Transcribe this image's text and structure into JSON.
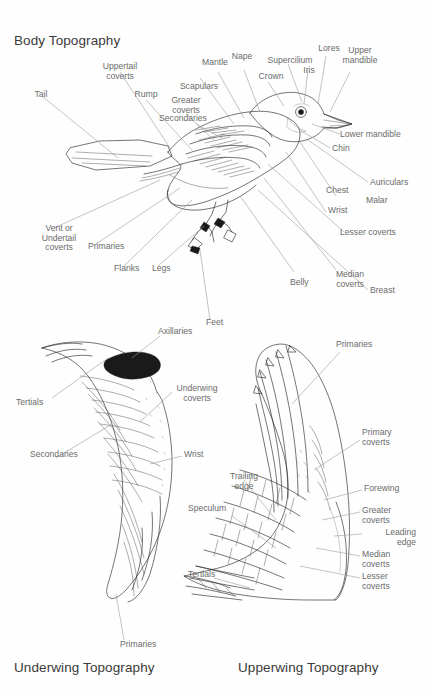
{
  "document": {
    "kind": "bird-anatomy-topography-diagram",
    "background_color": "#fefefe",
    "label_color": "#6b6b6b",
    "title_color": "#3a3a3a",
    "ink_color": "#2b2b2b",
    "leader_color": "#9a9a9a"
  },
  "sections": {
    "body": {
      "title": "Body Topography",
      "labels": [
        {
          "id": "tail",
          "text": "Tail"
        },
        {
          "id": "uppertail-coverts",
          "text": "Uppertail\ncoverts"
        },
        {
          "id": "rump",
          "text": "Rump"
        },
        {
          "id": "greater-coverts",
          "text": "Greater\ncoverts"
        },
        {
          "id": "secondaries",
          "text": "Secondaries"
        },
        {
          "id": "scapulars",
          "text": "Scapulars"
        },
        {
          "id": "mantle",
          "text": "Mantle"
        },
        {
          "id": "nape",
          "text": "Nape"
        },
        {
          "id": "crown",
          "text": "Crown"
        },
        {
          "id": "supercilium",
          "text": "Supercilium"
        },
        {
          "id": "iris",
          "text": "Iris"
        },
        {
          "id": "lores",
          "text": "Lores"
        },
        {
          "id": "upper-mandible",
          "text": "Upper\nmandible"
        },
        {
          "id": "lower-mandible",
          "text": "Lower mandible"
        },
        {
          "id": "chin",
          "text": "Chin"
        },
        {
          "id": "auriculars",
          "text": "Auriculars"
        },
        {
          "id": "malar",
          "text": "Malar"
        },
        {
          "id": "chest",
          "text": "Chest"
        },
        {
          "id": "wrist",
          "text": "Wrist"
        },
        {
          "id": "lesser-coverts",
          "text": "Lesser coverts"
        },
        {
          "id": "median-coverts",
          "text": "Median\ncoverts"
        },
        {
          "id": "breast",
          "text": "Breast"
        },
        {
          "id": "belly",
          "text": "Belly"
        },
        {
          "id": "feet",
          "text": "Feet"
        },
        {
          "id": "legs",
          "text": "Legs"
        },
        {
          "id": "flanks",
          "text": "Flanks"
        },
        {
          "id": "primaries",
          "text": "Primaries"
        },
        {
          "id": "vent-or-undertail-coverts",
          "text": "Vent or\nUndertail\ncoverts"
        }
      ]
    },
    "underwing": {
      "title": "Underwing Topography",
      "labels": [
        {
          "id": "axillaries",
          "text": "Axillaries"
        },
        {
          "id": "underwing-coverts",
          "text": "Underwing\ncoverts"
        },
        {
          "id": "tertials",
          "text": "Tertials"
        },
        {
          "id": "secondaries",
          "text": "Secondaries"
        },
        {
          "id": "wrist",
          "text": "Wrist"
        },
        {
          "id": "primaries",
          "text": "Primaries"
        }
      ]
    },
    "upperwing": {
      "title": "Upperwing Topography",
      "labels": [
        {
          "id": "primaries",
          "text": "Primaries"
        },
        {
          "id": "primary-coverts",
          "text": "Primary\ncoverts"
        },
        {
          "id": "forewing",
          "text": "Forewing"
        },
        {
          "id": "greater-coverts",
          "text": "Greater\ncoverts"
        },
        {
          "id": "leading-edge",
          "text": "Leading\nedge"
        },
        {
          "id": "median-coverts",
          "text": "Median\ncoverts"
        },
        {
          "id": "lesser-coverts",
          "text": "Lesser\ncoverts"
        },
        {
          "id": "trailing-edge",
          "text": "Trailing\nedge"
        },
        {
          "id": "speculum",
          "text": "Speculum"
        },
        {
          "id": "tertials",
          "text": "Tertials"
        }
      ]
    }
  }
}
